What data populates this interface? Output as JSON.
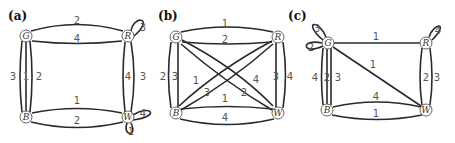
{
  "panels": [
    {
      "id": "a",
      "label": "(a)",
      "nodes": {
        "G": "G",
        "R": "R",
        "B": "B",
        "W": "W"
      },
      "edges": {
        "GR_top": "2",
        "GR_bottom": "4",
        "R_loop": "3",
        "GB_left": "3",
        "GB_mid": "1",
        "GB_right": "2",
        "RW_left": "4",
        "RW_right": "3",
        "BW_top": "1",
        "BW_bottom": "2",
        "W_loop_right": "4",
        "W_loop_bottom": "1"
      }
    },
    {
      "id": "b",
      "label": "(b)",
      "nodes": {
        "G": "G",
        "R": "R",
        "B": "B",
        "W": "W"
      },
      "edges": {
        "GR_top": "1",
        "GR_bottom": "2",
        "GB_left": "2",
        "GB_right": "3",
        "RW_left": "3",
        "RW_right": "4",
        "BR_diag1": "1",
        "BR_diag2": "3",
        "GW_diag1": "4",
        "GW_diag2": "2",
        "BW_top": "1",
        "BW_bottom": "4"
      }
    },
    {
      "id": "c",
      "label": "(c)",
      "nodes": {
        "G": "G",
        "R": "R",
        "B": "B",
        "W": "W"
      },
      "edges": {
        "G_loop_top": "3",
        "G_loop_left": "2",
        "GR": "1",
        "GW_diag": "1",
        "R_loop": "4",
        "GB_left": "4",
        "GB_mid": "2",
        "GB_right": "3",
        "RW_left": "2",
        "RW_right": "3",
        "BW_top": "4",
        "BW_bottom": "1"
      }
    }
  ]
}
